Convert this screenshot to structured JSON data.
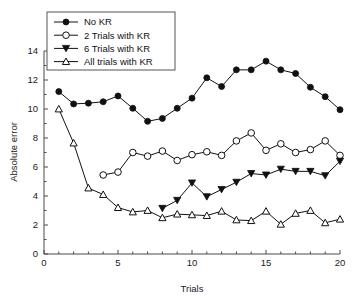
{
  "chart_data": {
    "type": "line",
    "title": "",
    "subtitle": "",
    "xlabel": "Trials",
    "ylabel": "Absolute error",
    "xlim": [
      0,
      20
    ],
    "ylim": [
      0,
      14
    ],
    "xticks": [
      0,
      5,
      10,
      15,
      20
    ],
    "yticks": [
      0,
      2,
      4,
      6,
      8,
      10,
      12,
      14
    ],
    "xtick_labels": [
      "0",
      "5",
      "10",
      "15",
      "20"
    ],
    "ytick_labels": [
      "0",
      "2",
      "4",
      "6",
      "8",
      "10",
      "12",
      "14"
    ],
    "xminor_ticks": [
      1,
      2,
      3,
      4,
      6,
      7,
      8,
      9,
      11,
      12,
      13,
      14,
      16,
      17,
      18,
      19
    ],
    "yminor_ticks": [
      1,
      3,
      5,
      7,
      9,
      11,
      13
    ],
    "grid": false,
    "legend_position": "top-left",
    "series": [
      {
        "name": "No KR",
        "marker": "filled-circle",
        "x": [
          1,
          2,
          3,
          4,
          5,
          6,
          7,
          8,
          9,
          10,
          11,
          12,
          13,
          14,
          15,
          16,
          17,
          18,
          19,
          20
        ],
        "values": [
          11.2,
          10.35,
          10.4,
          10.5,
          10.9,
          10.05,
          9.15,
          9.35,
          10.05,
          10.75,
          12.15,
          11.55,
          12.7,
          12.7,
          13.3,
          12.7,
          12.45,
          11.5,
          10.85,
          9.95
        ]
      },
      {
        "name": "2 Trials with KR",
        "marker": "open-circle",
        "x": [
          4,
          5,
          6,
          7,
          8,
          9,
          10,
          11,
          12,
          13,
          14,
          15,
          16,
          17,
          18,
          19,
          20
        ],
        "values": [
          5.45,
          5.65,
          7.0,
          6.75,
          7.1,
          6.45,
          6.85,
          7.05,
          6.8,
          7.8,
          8.35,
          7.15,
          7.6,
          7.0,
          7.2,
          7.8,
          6.8
        ]
      },
      {
        "name": "6 Trials with KR",
        "marker": "filled-triangle-down",
        "x": [
          8,
          9,
          10,
          11,
          12,
          13,
          14,
          15,
          16,
          17,
          18,
          19,
          20
        ],
        "values": [
          3.15,
          3.7,
          4.9,
          3.95,
          4.45,
          4.95,
          5.55,
          5.45,
          5.85,
          5.7,
          5.7,
          5.4,
          6.4
        ]
      },
      {
        "name": "All trials with KR",
        "marker": "open-triangle-up",
        "x": [
          1,
          2,
          3,
          4,
          5,
          6,
          7,
          8,
          9,
          10,
          11,
          12,
          13,
          14,
          15,
          16,
          17,
          18,
          19,
          20
        ],
        "values": [
          10.0,
          7.65,
          4.55,
          4.1,
          3.2,
          2.9,
          3.0,
          2.5,
          2.75,
          2.7,
          2.65,
          2.95,
          2.35,
          2.3,
          2.95,
          2.05,
          2.8,
          3.0,
          2.15,
          2.4
        ]
      }
    ]
  },
  "legend": {
    "entries": [
      {
        "label": "No KR"
      },
      {
        "label": "2 Trials with KR"
      },
      {
        "label": "6 Trials with KR"
      },
      {
        "label": "All trials with KR"
      }
    ]
  },
  "colors": {
    "line": "#111111",
    "axis": "#4a4a4a",
    "text": "#1a1a1a",
    "background": "#ffffff",
    "legend_border": "#555555"
  }
}
